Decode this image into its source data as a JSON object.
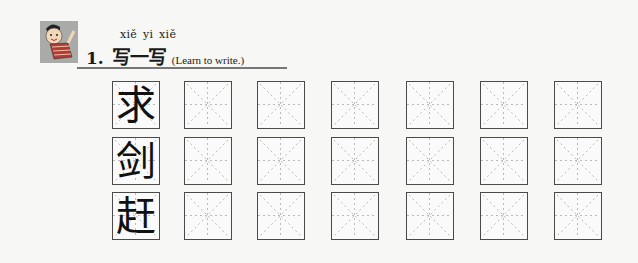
{
  "header": {
    "pinyin": "xiě yi xiě",
    "number": "1.",
    "title": "写一写",
    "subtitle": "(Learn to write.)",
    "icon": "child-mascot-icon"
  },
  "practice": {
    "characters": [
      "求",
      "剑",
      "赶"
    ],
    "practice_cells_per_row": 6,
    "column_x": [
      112,
      184,
      257,
      331,
      406,
      480,
      554
    ],
    "row_y": [
      81,
      137,
      192
    ]
  }
}
